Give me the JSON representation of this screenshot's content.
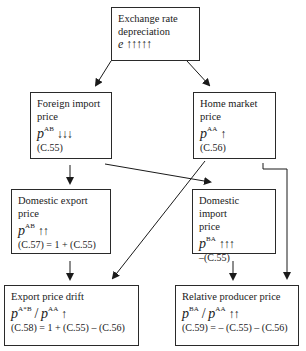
{
  "nodes": {
    "exchange_rate": {
      "title_line1": "Exchange rate",
      "title_line2": "depreciation",
      "symbol": "e",
      "superscript": "",
      "arrows": "↑↑↑↑↑"
    },
    "foreign_import": {
      "title_line1": "Foreign import",
      "title_line2": "price",
      "symbol": "p",
      "superscript": "AB",
      "arrows": "↓↓↓",
      "equation": "(C.55)"
    },
    "home_market": {
      "title_line1": "Home market",
      "title_line2": "price",
      "symbol": "p",
      "superscript": "AA",
      "arrows": "↑",
      "equation": "(C.56)"
    },
    "domestic_export": {
      "title_line1": "Domestic export",
      "title_line2": "price",
      "symbol": "p",
      "superscript": "AB",
      "arrows": "↑↑",
      "equation": "(C.57) = 1 + (C.55)"
    },
    "domestic_import": {
      "title_line1": "Domestic import",
      "title_line2": "price",
      "symbol": "p",
      "superscript": "BA",
      "arrows": "↑↑↑",
      "equation": "–(C.55)"
    },
    "export_price_drift": {
      "title_line1": "Export price drift",
      "symbol_num": "p",
      "superscript_num": "A*B",
      "divider": "/",
      "symbol_den": "p",
      "superscript_den": "AA",
      "arrows": "↑",
      "equation": "(C.58) = 1 + (C.55) – (C.56)"
    },
    "relative_producer_price": {
      "title_line1": "Relative producer price",
      "symbol_num": "p",
      "superscript_num": "BA",
      "divider": "/",
      "symbol_den": "p",
      "superscript_den": "AA",
      "arrows": "↑↑",
      "equation": "(C.59) = – (C.55) – (C.56)"
    }
  },
  "edges": [
    {
      "from": "exchange_rate",
      "to": "foreign_import"
    },
    {
      "from": "exchange_rate",
      "to": "home_market"
    },
    {
      "from": "foreign_import",
      "to": "domestic_export"
    },
    {
      "from": "foreign_import",
      "to": "domestic_import"
    },
    {
      "from": "home_market",
      "to": "export_price_drift"
    },
    {
      "from": "home_market",
      "to": "relative_producer_price"
    },
    {
      "from": "domestic_export",
      "to": "export_price_drift"
    },
    {
      "from": "domestic_import",
      "to": "relative_producer_price"
    }
  ],
  "colors": {
    "line": "#1a1a1a",
    "background": "#ffffff"
  }
}
